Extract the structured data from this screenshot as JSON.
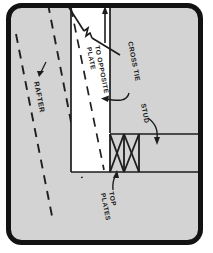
{
  "figure": {
    "caption_visible": false,
    "background_color": "#d3d3d3",
    "border_color": "#121212",
    "paper_color": "#ffffff",
    "line_color": "#1c1c1c",
    "wall_fill": "#ffffff"
  },
  "labels": {
    "rafter": "RAFTER",
    "to_opposite_plate_line1": "TO OPPOSITE",
    "to_opposite_plate_line2": "PLATE",
    "cross_tie": "CROSS TIE",
    "stud": "STUD",
    "top_plates_line1": "TOP",
    "top_plates_line2": "PLATES"
  },
  "elements": {
    "rafter_dashed_lines": 2,
    "stud_bays_with_x_bracing": 2,
    "cross_tie_arrow": "up-arrow",
    "rafter_leader": "straight-arrow",
    "cross_tie_leader": "curved-arrow-left",
    "stud_leader": "curved-arrow-down",
    "top_plates_leader": "straight-arrow-up"
  }
}
